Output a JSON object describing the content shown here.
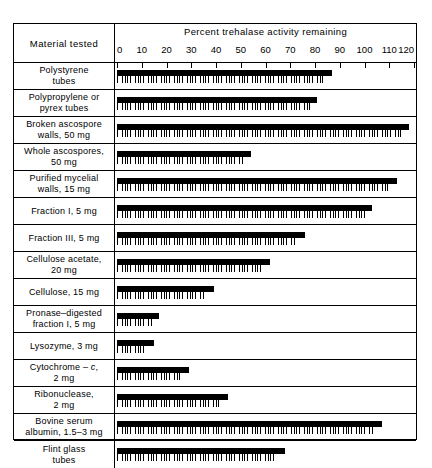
{
  "header": {
    "material_column": "Material tested",
    "axis_title": "Percent trehalase activity remaining"
  },
  "chart_data": {
    "type": "bar",
    "orientation": "horizontal",
    "title": "Percent trehalase activity remaining",
    "xlabel": "Percent trehalase activity remaining",
    "ylabel": "Material tested",
    "xlim": [
      0,
      120
    ],
    "xticks": [
      0,
      10,
      20,
      30,
      40,
      50,
      60,
      70,
      80,
      90,
      100,
      110,
      120
    ],
    "grid": false,
    "legend": "none",
    "categories": [
      "Polystyrene tubes",
      "Polypropylene or pyrex tubes",
      "Broken ascospore walls, 50 mg",
      "Whole ascospores, 50 mg",
      "Purified mycelial walls, 15 mg",
      "Fraction I, 5 mg",
      "Fraction III, 5 mg",
      "Cellulose acetate, 20 mg",
      "Cellulose, 15 mg",
      "Pronase–digested fraction I, 5 mg",
      "Lysozyme, 3 mg",
      "Cytochrome – c, 2 mg",
      "Ribonuclease, 2 mg",
      "Bovine serum albumin, 1.5–3 mg",
      "Flint glass tubes"
    ],
    "series": [
      {
        "name": "solid bar",
        "values": [
          87,
          81,
          118,
          54,
          113,
          103,
          76,
          62,
          39,
          17,
          15,
          29,
          45,
          107,
          68
        ]
      },
      {
        "name": "hatched band",
        "values": [
          84,
          78,
          115,
          51,
          110,
          100,
          72,
          58,
          35,
          14,
          12,
          26,
          42,
          104,
          64
        ]
      }
    ]
  },
  "rows": [
    {
      "label_lines": [
        "Polystyrene",
        "tubes"
      ]
    },
    {
      "label_lines": [
        "Polypropylene or",
        "pyrex tubes"
      ]
    },
    {
      "label_lines": [
        "Broken ascospore",
        "walls, 50 mg"
      ]
    },
    {
      "label_lines": [
        "Whole ascospores,",
        "50 mg"
      ]
    },
    {
      "label_lines": [
        "Purified mycelial",
        "walls, 15 mg"
      ]
    },
    {
      "label_lines": [
        "Fraction I, 5 mg"
      ]
    },
    {
      "label_lines": [
        "Fraction III, 5 mg"
      ]
    },
    {
      "label_lines": [
        "Cellulose acetate,",
        "20 mg"
      ]
    },
    {
      "label_lines": [
        "Cellulose, 15 mg"
      ]
    },
    {
      "label_lines": [
        "Pronase–digested",
        "fraction I, 5 mg"
      ]
    },
    {
      "label_lines": [
        "Lysozyme, 3 mg"
      ]
    },
    {
      "label_lines": [
        "Cytochrome – ",
        "2 mg"
      ],
      "italic_token": "c",
      "italic_after_line": 0,
      "italic_suffix": ","
    },
    {
      "label_lines": [
        "Ribonuclease,",
        "2 mg"
      ]
    },
    {
      "label_lines": [
        "Bovine serum",
        "albumin, 1.5–3 mg"
      ]
    },
    {
      "label_lines": [
        "Flint glass",
        "tubes"
      ]
    }
  ]
}
